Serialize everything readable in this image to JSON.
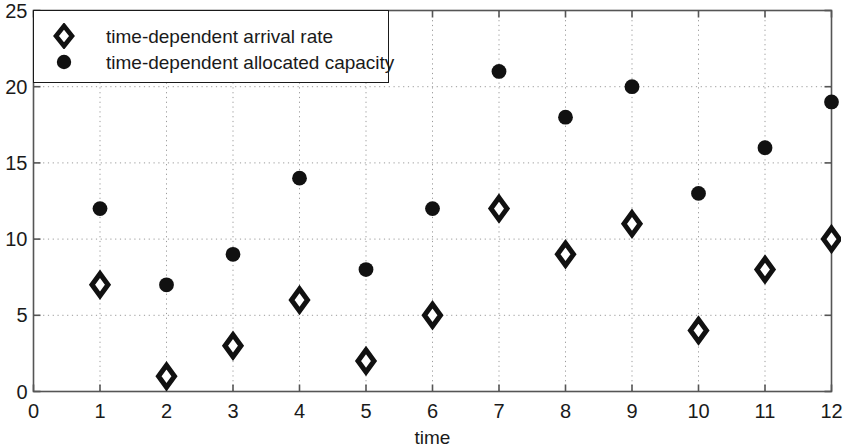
{
  "chart_data": {
    "type": "scatter",
    "title": "",
    "xlabel": "time",
    "ylabel": "",
    "xlim": [
      0,
      12
    ],
    "ylim": [
      0,
      25
    ],
    "xticks": [
      "0",
      "1",
      "2",
      "3",
      "4",
      "5",
      "6",
      "7",
      "8",
      "9",
      "10",
      "11",
      "12"
    ],
    "yticks": [
      "0",
      "5",
      "10",
      "15",
      "20",
      "25"
    ],
    "grid": true,
    "grid_style": "dotted",
    "legend_position": "top-left",
    "x": [
      1,
      2,
      3,
      4,
      5,
      6,
      7,
      8,
      9,
      10,
      11,
      12
    ],
    "series": [
      {
        "name": "time-dependent arrival rate",
        "marker": "diamond-open",
        "color": "#111111",
        "values": [
          7,
          1,
          3,
          6,
          2,
          5,
          12,
          9,
          11,
          4,
          8,
          10
        ]
      },
      {
        "name": "time-dependent allocated capacity",
        "marker": "circle-filled",
        "color": "#111111",
        "values": [
          12,
          7,
          9,
          14,
          8,
          12,
          21,
          18,
          20,
          13,
          16,
          19
        ]
      }
    ]
  },
  "axes": {
    "frame_color": "#555555",
    "grid_color": "#9a9a9a",
    "text_color": "#1a1a1a"
  }
}
